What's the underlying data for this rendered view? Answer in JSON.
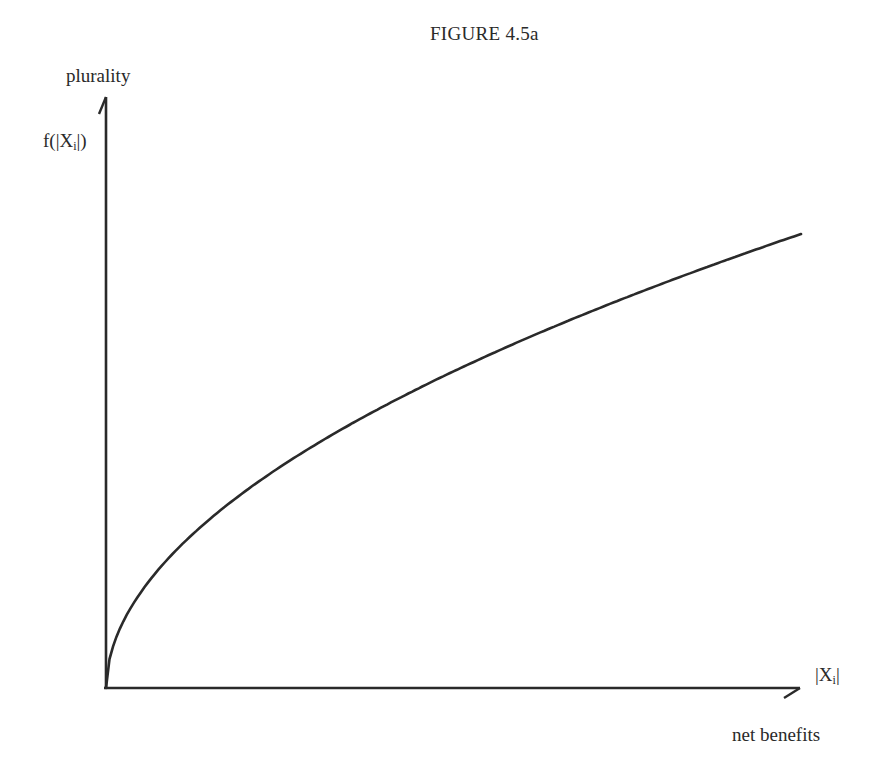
{
  "figure": {
    "title": "FIGURE 4.5a",
    "y_axis_label": "plurality",
    "y_axis_function": "f(|X",
    "y_axis_function_sub": "i",
    "y_axis_function_close": "|)",
    "x_axis_variable": "|X",
    "x_axis_variable_sub": "i",
    "x_axis_variable_close": "|",
    "x_axis_label": "net benefits",
    "line_color": "#2a2a2a",
    "background_color": "#ffffff"
  },
  "chart_data": {
    "type": "line",
    "title": "FIGURE 4.5a",
    "xlabel": "net benefits",
    "xvar": "|Xi|",
    "ylabel": "plurality",
    "yvar": "f(|Xi|)",
    "grid": false,
    "legend": null,
    "axis_ticks": "none (schematic diagram, no numeric scale)",
    "xlim": [
      0,
      1
    ],
    "ylim": [
      0,
      1
    ],
    "series": [
      {
        "name": "f(|Xi|)",
        "shape": "concave increasing (approx. square-root), starting at origin",
        "x": [
          0,
          0.05,
          0.1,
          0.2,
          0.3,
          0.4,
          0.5,
          0.6,
          0.7,
          0.8,
          0.9,
          1.0
        ],
        "y": [
          0,
          0.17,
          0.25,
          0.36,
          0.44,
          0.51,
          0.57,
          0.63,
          0.68,
          0.73,
          0.78,
          0.82
        ]
      }
    ]
  }
}
